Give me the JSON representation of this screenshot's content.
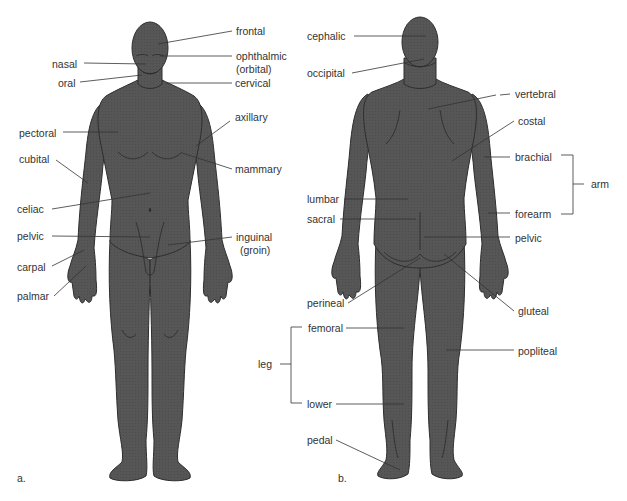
{
  "colors": {
    "body": "#555555",
    "body_stroke": "#2e2e2e",
    "line": "#333333",
    "text": "#333333"
  },
  "panels": [
    {
      "id": "a",
      "caption": "a.",
      "view": "anterior"
    },
    {
      "id": "b",
      "caption": "b.",
      "view": "posterior"
    }
  ],
  "anterior_labels": [
    {
      "text": "frontal",
      "x": 236,
      "y": 25
    },
    {
      "text": "nasal",
      "x": 52,
      "y": 58
    },
    {
      "text": "ophthalmic",
      "x": 236,
      "y": 50
    },
    {
      "text": "(orbital)",
      "x": 236,
      "y": 63
    },
    {
      "text": "oral",
      "x": 58,
      "y": 77
    },
    {
      "text": "cervical",
      "x": 235,
      "y": 77
    },
    {
      "text": "axillary",
      "x": 235,
      "y": 111
    },
    {
      "text": "pectoral",
      "x": 19,
      "y": 127
    },
    {
      "text": "cubital",
      "x": 19,
      "y": 153
    },
    {
      "text": "mammary",
      "x": 235,
      "y": 163
    },
    {
      "text": "celiac",
      "x": 17,
      "y": 203
    },
    {
      "text": "pelvic",
      "x": 17,
      "y": 230
    },
    {
      "text": "inguinal",
      "x": 236,
      "y": 231
    },
    {
      "text": "(groin)",
      "x": 240,
      "y": 244
    },
    {
      "text": "carpal",
      "x": 17,
      "y": 261
    },
    {
      "text": "palmar",
      "x": 17,
      "y": 290
    }
  ],
  "posterior_labels": [
    {
      "text": "cephalic",
      "x": 307,
      "y": 30
    },
    {
      "text": "occipital",
      "x": 307,
      "y": 67
    },
    {
      "text": "vertebral",
      "x": 497,
      "y": 88
    },
    {
      "text": "costal",
      "x": 497,
      "y": 115
    },
    {
      "text": "brachial",
      "x": 497,
      "y": 151
    },
    {
      "text": "arm",
      "x": 591,
      "y": 178
    },
    {
      "text": "lumbar",
      "x": 307,
      "y": 193
    },
    {
      "text": "sacral",
      "x": 307,
      "y": 213
    },
    {
      "text": "forearm",
      "x": 497,
      "y": 208
    },
    {
      "text": "pelvic",
      "x": 497,
      "y": 232
    },
    {
      "text": "perineal",
      "x": 307,
      "y": 297
    },
    {
      "text": "gluteal",
      "x": 518,
      "y": 305
    },
    {
      "text": "femoral",
      "x": 308,
      "y": 322
    },
    {
      "text": "popliteal",
      "x": 518,
      "y": 345
    },
    {
      "text": "leg",
      "x": 258,
      "y": 358
    },
    {
      "text": "lower",
      "x": 307,
      "y": 398
    },
    {
      "text": "pedal",
      "x": 307,
      "y": 434
    }
  ],
  "captions": {
    "a": "a.",
    "b": "b."
  }
}
